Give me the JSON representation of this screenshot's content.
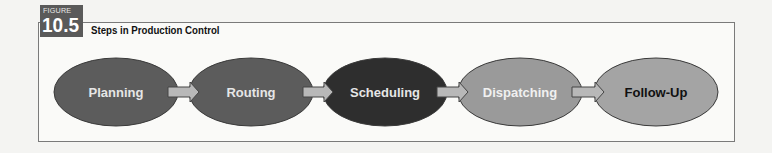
{
  "figure": {
    "badge_label": "FIGURE",
    "number": "10.5",
    "title": "Steps in Production Control"
  },
  "diagram": {
    "type": "flow",
    "steps": [
      {
        "label": "Planning",
        "fill": "#5c5c5c",
        "text_color": "#e6e6e6"
      },
      {
        "label": "Routing",
        "fill": "#5c5c5c",
        "text_color": "#e6e6e6"
      },
      {
        "label": "Scheduling",
        "fill": "#2e2e2e",
        "text_color": "#e6e6e6"
      },
      {
        "label": "Dispatching",
        "fill": "#9a9a9a",
        "text_color": "#f0f0f0"
      },
      {
        "label": "Follow-Up",
        "fill": "#a4a4a4",
        "text_color": "#111111"
      }
    ],
    "arrow_fill": "#b8b8b8",
    "arrow_stroke": "#444444"
  }
}
